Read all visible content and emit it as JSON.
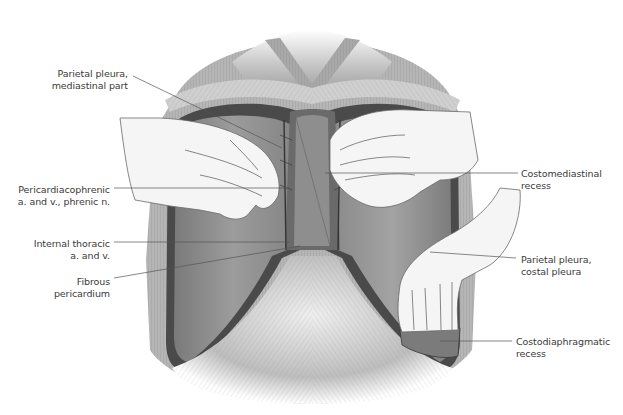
{
  "figure": {
    "colors": {
      "background": "#ffffff",
      "tissue_dark": "#5a5a5a",
      "tissue_mid": "#9a9a9a",
      "tissue_light": "#d8d8d8",
      "glove": "#f4f4f4",
      "label_text": "#3a3a3a",
      "leader_line": "#555555"
    }
  },
  "labels": {
    "left": [
      {
        "id": "parietal-pleura-mediastinal",
        "lines": [
          "Parietal pleura,",
          "mediastinal part"
        ]
      },
      {
        "id": "pericardiacophrenic",
        "lines": [
          "Pericardiacophrenic",
          "a. and v., phrenic n."
        ]
      },
      {
        "id": "internal-thoracic",
        "lines": [
          "Internal thoracic",
          "a. and v."
        ]
      },
      {
        "id": "fibrous-pericardium",
        "lines": [
          "Fibrous",
          "pericardium"
        ]
      }
    ],
    "right": [
      {
        "id": "costomediastinal-recess",
        "lines": [
          "Costomediastinal",
          "recess"
        ]
      },
      {
        "id": "parietal-pleura-costal",
        "lines": [
          "Parietal pleura,",
          "costal pleura"
        ]
      },
      {
        "id": "costodiaphragmatic-recess",
        "lines": [
          "Costodiaphragmatic",
          "recess"
        ]
      }
    ]
  }
}
